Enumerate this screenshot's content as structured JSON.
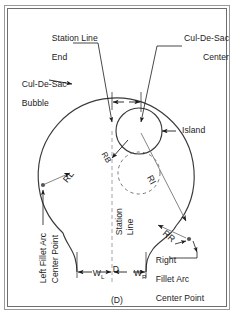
{
  "figure": {
    "caption": "(D)",
    "frame_color": "#6e6e6e",
    "line_color": "#3a3a3a",
    "text_color": "#1b1b1b",
    "background": "#ffffff"
  },
  "labels": {
    "station_line_end": {
      "line1": "Station Line",
      "line2": "End"
    },
    "cul_de_sac_center": {
      "line1": "Cul-De-Sac",
      "line2": "Center"
    },
    "cul_de_sac_bubble": {
      "line1": "Cul-De-Sac",
      "line2": "Bubble"
    },
    "island": "Island",
    "station_line_vertical": {
      "line1": "Station",
      "line2": "Line"
    },
    "left_fillet_center": {
      "line1": "Left Fillet Arc",
      "line2": "Center Point"
    },
    "right_fillet_center": {
      "line1": "Right",
      "line2": "Fillet Arc",
      "line3": "Center Point"
    }
  },
  "dimensions": {
    "d": {
      "symbol": "D",
      "description": "offset from station line end to cul-de-sac center"
    },
    "w_left": {
      "symbol": "W",
      "subscript": "L",
      "description": "left half roadway width"
    },
    "w_right": {
      "symbol": "W",
      "subscript": "R",
      "description": "right half roadway width"
    },
    "r_left": {
      "symbol": "R",
      "subscript": "L",
      "description": "left fillet arc radius"
    },
    "r_right": {
      "symbol": "R",
      "subscript": "R",
      "description": "right fillet arc radius"
    },
    "r_island": {
      "symbol": "R",
      "subscript": "I",
      "description": "island radius"
    },
    "r_bubble": {
      "symbol": "R",
      "subscript": "B",
      "description": "cul-de-sac bubble radius"
    }
  },
  "geometry": {
    "bubble": {
      "cx": 120,
      "cy": 163,
      "r": 78
    },
    "island": {
      "cx": 139,
      "cy": 131,
      "r": 23
    },
    "dashed_island": {
      "cx": 139,
      "cy": 173,
      "r": 21
    },
    "station_line_x": 112,
    "station_line_end_y": 131
  }
}
